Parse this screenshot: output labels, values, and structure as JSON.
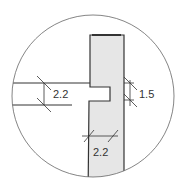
{
  "diagram": {
    "type": "detail-section",
    "colors": {
      "wall_fill": "#e6e6e6",
      "line": "#333333",
      "circle": "#666666"
    },
    "dimensions": [
      {
        "id": "slab-thickness",
        "label": "2.2"
      },
      {
        "id": "notch-offset",
        "label": "1.5"
      },
      {
        "id": "wall-thickness",
        "label": "2.2"
      }
    ]
  }
}
